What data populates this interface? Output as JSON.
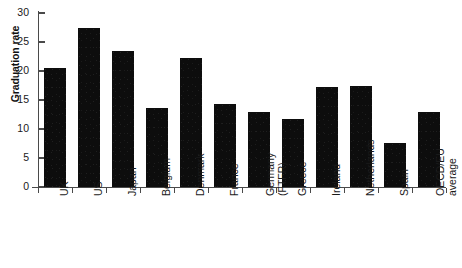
{
  "chart_data": {
    "type": "bar",
    "title": "",
    "xlabel": "",
    "ylabel": "Graduation rate",
    "ylim": [
      0,
      30
    ],
    "yticks": [
      0,
      5,
      10,
      15,
      20,
      25,
      30
    ],
    "grid": false,
    "legend": false,
    "bar_color": "#0d0d0d",
    "axis_color": "#4a4a4a",
    "categories": [
      "UK",
      "US",
      "Japan",
      "Belgium",
      "Denmark",
      "France",
      "Germany (FTFR)",
      "Greece",
      "Ireland",
      "Netherlands",
      "Spain",
      "OECD/EU average"
    ],
    "category_lines": [
      [
        "UK"
      ],
      [
        "US"
      ],
      [
        "Japan"
      ],
      [
        "Belgium"
      ],
      [
        "Denmark"
      ],
      [
        "France"
      ],
      [
        "Germany",
        "(FTFR)"
      ],
      [
        "Greece"
      ],
      [
        "Ireland"
      ],
      [
        "Netherlands"
      ],
      [
        "Spain"
      ],
      [
        "OECD/EU",
        "average"
      ]
    ],
    "values": [
      20.5,
      27.4,
      23.4,
      13.6,
      22.2,
      14.3,
      13.0,
      11.8,
      17.3,
      17.5,
      7.6,
      12.9
    ]
  },
  "axis": {
    "tick_0": "0",
    "tick_5": "5",
    "tick_10": "10",
    "tick_15": "15",
    "tick_20": "20",
    "tick_25": "25",
    "tick_30": "30"
  }
}
